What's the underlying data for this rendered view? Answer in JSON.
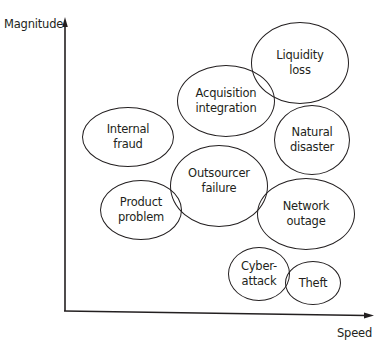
{
  "diagram": {
    "y_axis_label": "Magnitude",
    "x_axis_label": "Speed",
    "line_color": "#231f20",
    "risks": [
      {
        "label": "Liquidity\nloss",
        "cx": 300,
        "cy": 63,
        "rx": 49,
        "ry": 41
      },
      {
        "label": "Acquisition\nintegration",
        "cx": 226,
        "cy": 101,
        "rx": 49,
        "ry": 36
      },
      {
        "label": "Natural\ndisaster",
        "cx": 312,
        "cy": 140,
        "rx": 38,
        "ry": 35
      },
      {
        "label": "Internal\nfraud",
        "cx": 128,
        "cy": 137,
        "rx": 46,
        "ry": 30
      },
      {
        "label": "Outsourcer\nfailure",
        "cx": 219,
        "cy": 186,
        "rx": 49,
        "ry": 41
      },
      {
        "label": "Product\nproblem",
        "cx": 141,
        "cy": 210,
        "rx": 41,
        "ry": 30
      },
      {
        "label": "Network\noutage",
        "cx": 306,
        "cy": 214,
        "rx": 49,
        "ry": 36
      },
      {
        "label": "Cyber-\nattack",
        "cx": 259,
        "cy": 274,
        "rx": 31,
        "ry": 27
      },
      {
        "label": "Theft",
        "cx": 313,
        "cy": 283,
        "rx": 28,
        "ry": 22
      }
    ]
  }
}
